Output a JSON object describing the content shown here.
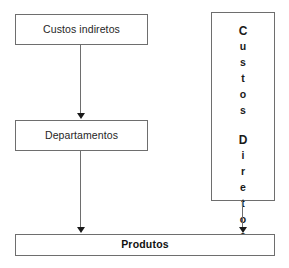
{
  "diagram": {
    "type": "flowchart",
    "background_color": "#ffffff",
    "border_color": "#6e6e6e",
    "text_color": "#262626",
    "nodes": {
      "custos_indiretos": {
        "label": "Custos indiretos",
        "style": "horizontal-box",
        "weight": "regular"
      },
      "departamentos": {
        "label": "Departamentos",
        "style": "horizontal-box",
        "weight": "regular"
      },
      "custos_diretos": {
        "label": "Custos Diretos",
        "style": "vertical-stacked-box",
        "weight": "bold",
        "lines": [
          {
            "text": "Custos",
            "chars": [
              "C",
              "u",
              "s",
              "t",
              "o",
              "s"
            ]
          },
          {
            "text": "Diretos",
            "chars": [
              "D",
              "i",
              "r",
              "e",
              "t",
              "o",
              "s"
            ]
          }
        ]
      },
      "produtos": {
        "label": "Produtos",
        "style": "horizontal-box",
        "weight": "bold"
      }
    },
    "edges": [
      {
        "id": "indiretos-to-departamentos",
        "from": "custos_indiretos",
        "to": "departamentos",
        "arrowhead": "filled-triangle-down"
      },
      {
        "id": "departamentos-to-produtos",
        "from": "departamentos",
        "to": "produtos",
        "arrowhead": "filled-triangle-down"
      },
      {
        "id": "diretos-to-produtos",
        "from": "custos_diretos",
        "to": "produtos",
        "arrowhead": "filled-triangle-down"
      }
    ]
  }
}
